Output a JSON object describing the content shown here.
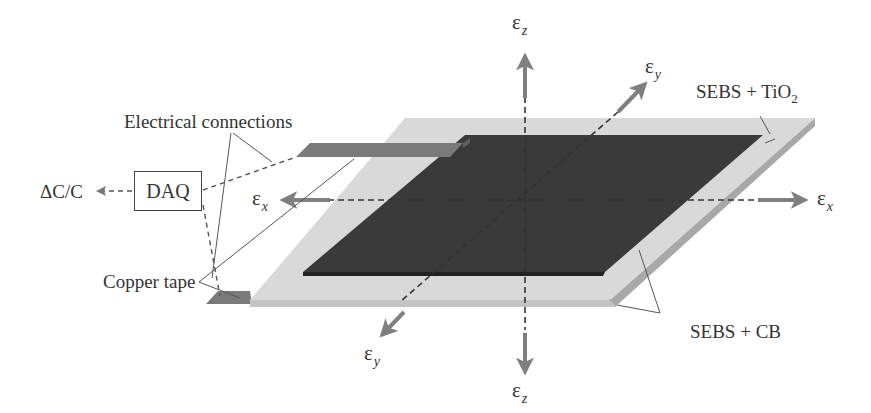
{
  "figure": {
    "type": "schematic"
  },
  "labels": {
    "electrical_connections": "Electrical connections",
    "copper_tape": "Copper tape",
    "daq": "DAQ",
    "output": "ΔC/C",
    "dielectric": {
      "text": "SEBS + TiO",
      "subscript": "2"
    },
    "electrodes": "SEBS + CB"
  },
  "axes": {
    "symbol": "ε",
    "x_pos": {
      "sub": "x"
    },
    "x_neg": {
      "sub": "x"
    },
    "y_pos": {
      "sub": "y"
    },
    "y_neg": {
      "sub": "y"
    },
    "z_pos": {
      "sub": "z"
    },
    "z_neg": {
      "sub": "z"
    }
  },
  "colors": {
    "dielectric": "#d9d9d9",
    "dielectric_edge": "#a8a8a8",
    "electrode": "#3a3a3a",
    "copper_tape": "#7a7a7a",
    "arrow": "#7f7f7f",
    "dashed_line": "#333333",
    "leader_line": "#555555"
  }
}
